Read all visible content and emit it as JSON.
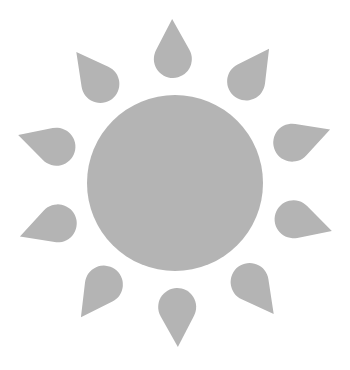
{
  "image": {
    "subject": "sun-icon",
    "colors": {
      "background": "#ffffff",
      "fill": "#b4b4b4"
    },
    "sun": {
      "cx": 175,
      "cy": 183,
      "r": 88
    },
    "rays": {
      "count": 10,
      "tip_distance": 164,
      "bulb_distance": 124,
      "bulb_radius": 19,
      "start_angle_deg": -1
    }
  }
}
